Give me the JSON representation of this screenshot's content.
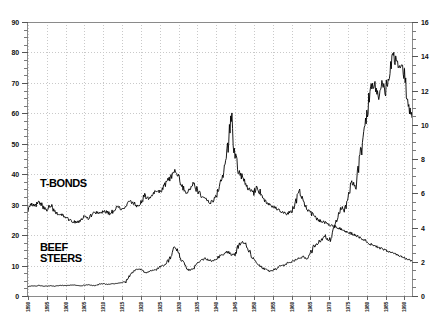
{
  "chart_data": {
    "type": "line",
    "title": "",
    "subtitle": "",
    "xlabel": "",
    "ylabel": "",
    "y2label": "",
    "grid": true,
    "legend_position": "inline-annotation",
    "xlim": [
      1890,
      1992
    ],
    "ylim": [
      0,
      90
    ],
    "y2lim": [
      0,
      16
    ],
    "xticks": [
      1890,
      1895,
      1900,
      1905,
      1910,
      1915,
      1920,
      1925,
      1930,
      1935,
      1940,
      1945,
      1950,
      1955,
      1960,
      1965,
      1970,
      1975,
      1980,
      1985,
      1990
    ],
    "xtick_labels": [
      "1890",
      "1895",
      "1900",
      "1905",
      "1910",
      "1915",
      "1920",
      "1925",
      "1930",
      "1935",
      "1940",
      "1945",
      "1950",
      "1955",
      "1960",
      "1965",
      "1970",
      "1975",
      "1980",
      "1985",
      "1990"
    ],
    "yticks": [
      0,
      10,
      20,
      30,
      40,
      50,
      60,
      70,
      80,
      90
    ],
    "ytick_labels": [
      "0",
      "10",
      "20",
      "30",
      "40",
      "50",
      "60",
      "70",
      "80",
      "90"
    ],
    "y2ticks": [
      0,
      2,
      4,
      6,
      8,
      10,
      12,
      14,
      16
    ],
    "y2tick_labels": [
      "0",
      "2",
      "4",
      "6",
      "8",
      "10",
      "12",
      "14",
      "16"
    ],
    "annotations": [
      {
        "text": "T-BONDS",
        "x": 1895,
        "y": 43,
        "axis": "left"
      },
      {
        "text": "BEEF\nSTEERS",
        "x": 1895,
        "y": 20,
        "axis": "left"
      }
    ],
    "series": [
      {
        "name": "T-BONDS",
        "axis": "left",
        "color": "#000000",
        "x": [
          1890,
          1891,
          1892,
          1893,
          1894,
          1895,
          1896,
          1897,
          1898,
          1899,
          1900,
          1901,
          1902,
          1903,
          1904,
          1905,
          1906,
          1907,
          1908,
          1909,
          1910,
          1911,
          1912,
          1913,
          1914,
          1915,
          1916,
          1917,
          1918,
          1919,
          1920,
          1921,
          1922,
          1923,
          1924,
          1925,
          1926,
          1927,
          1928,
          1929,
          1930,
          1931,
          1932,
          1933,
          1934,
          1935,
          1936,
          1937,
          1938,
          1939,
          1940,
          1941,
          1942,
          1943,
          1944,
          1945,
          1946,
          1947,
          1948,
          1949,
          1950,
          1951,
          1952,
          1953,
          1954,
          1955,
          1956,
          1957,
          1958,
          1959,
          1960,
          1961,
          1962,
          1963,
          1964,
          1965,
          1966,
          1967,
          1968,
          1969,
          1970,
          1971,
          1972,
          1973,
          1974,
          1975,
          1976,
          1977,
          1978,
          1979,
          1980,
          1981,
          1982,
          1983,
          1984,
          1985,
          1986,
          1987,
          1988,
          1989,
          1990,
          1991,
          1992
        ],
        "values": [
          28.5,
          30.0,
          29.5,
          31.0,
          29.0,
          28.5,
          30.0,
          28.0,
          27.0,
          26.5,
          26.0,
          25.0,
          24.5,
          24.0,
          25.0,
          26.0,
          25.5,
          27.0,
          27.5,
          27.0,
          28.0,
          27.5,
          27.0,
          28.5,
          29.5,
          28.5,
          29.0,
          31.0,
          30.5,
          29.5,
          31.0,
          33.0,
          32.0,
          33.5,
          34.5,
          34.0,
          36.0,
          37.5,
          39.0,
          41.5,
          39.0,
          36.0,
          34.0,
          35.5,
          37.0,
          34.5,
          33.0,
          32.0,
          30.5,
          31.0,
          33.0,
          36.0,
          42.0,
          48.0,
          59.0,
          47.0,
          41.0,
          38.5,
          36.0,
          35.0,
          34.0,
          36.0,
          33.0,
          31.0,
          30.0,
          29.5,
          29.0,
          28.0,
          27.5,
          27.0,
          28.0,
          30.0,
          35.0,
          31.0,
          29.0,
          27.5,
          26.0,
          25.0,
          24.5,
          24.0,
          23.5,
          23.0,
          22.5,
          22.0,
          21.5,
          21.0,
          20.5,
          20.0,
          19.5,
          18.5,
          18.0,
          17.0,
          16.5,
          16.0,
          15.5,
          15.0,
          14.5,
          14.0,
          13.5,
          13.0,
          12.5,
          12.0,
          11.5
        ]
      },
      {
        "name": "BEEF STEERS",
        "axis": "right",
        "color": "#000000",
        "x": [
          1890,
          1891,
          1892,
          1893,
          1894,
          1895,
          1896,
          1897,
          1898,
          1899,
          1900,
          1901,
          1902,
          1903,
          1904,
          1905,
          1906,
          1907,
          1908,
          1909,
          1910,
          1911,
          1912,
          1913,
          1914,
          1915,
          1916,
          1917,
          1918,
          1919,
          1920,
          1921,
          1922,
          1923,
          1924,
          1925,
          1926,
          1927,
          1928,
          1929,
          1930,
          1931,
          1932,
          1933,
          1934,
          1935,
          1936,
          1937,
          1938,
          1939,
          1940,
          1941,
          1942,
          1943,
          1944,
          1945,
          1946,
          1947,
          1948,
          1949,
          1950,
          1951,
          1952,
          1953,
          1954,
          1955,
          1956,
          1957,
          1958,
          1959,
          1960,
          1961,
          1962,
          1963,
          1964,
          1965,
          1966,
          1967,
          1968,
          1969,
          1970,
          1971,
          1972,
          1973,
          1974,
          1975,
          1976,
          1977,
          1978,
          1979,
          1980,
          1981,
          1982,
          1983,
          1984,
          1985,
          1986,
          1987,
          1988,
          1989,
          1990,
          1991,
          1992
        ],
        "values": [
          0.55,
          0.6,
          0.58,
          0.62,
          0.55,
          0.58,
          0.6,
          0.57,
          0.6,
          0.62,
          0.6,
          0.63,
          0.65,
          0.62,
          0.6,
          0.63,
          0.65,
          0.62,
          0.6,
          0.7,
          0.72,
          0.68,
          0.7,
          0.72,
          0.75,
          0.78,
          0.85,
          1.2,
          1.45,
          1.55,
          1.6,
          1.35,
          1.4,
          1.5,
          1.55,
          1.7,
          1.8,
          1.95,
          2.35,
          2.85,
          2.55,
          2.0,
          1.65,
          1.5,
          1.6,
          1.95,
          2.05,
          2.2,
          2.1,
          2.05,
          2.15,
          2.35,
          2.45,
          2.6,
          2.4,
          2.45,
          2.95,
          3.2,
          3.0,
          2.55,
          2.1,
          1.9,
          1.7,
          1.55,
          1.45,
          1.5,
          1.6,
          1.75,
          1.8,
          1.95,
          2.0,
          2.1,
          2.2,
          2.3,
          2.2,
          2.45,
          2.9,
          3.1,
          3.3,
          3.5,
          3.2,
          3.6,
          4.4,
          5.2,
          5.0,
          5.6,
          6.6,
          6.4,
          7.8,
          9.2,
          10.6,
          12.2,
          12.4,
          11.6,
          12.4,
          12.0,
          13.0,
          14.0,
          13.6,
          13.4,
          12.9,
          11.2,
          10.4
        ]
      }
    ]
  }
}
